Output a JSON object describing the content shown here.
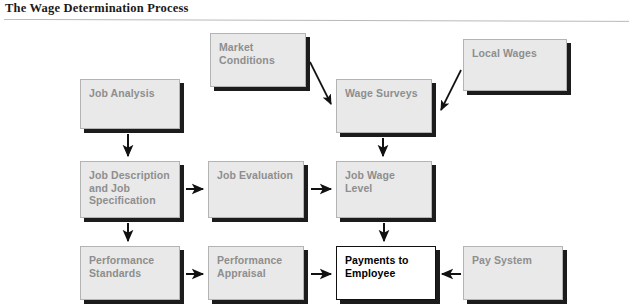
{
  "title": "The Wage Determination Process",
  "diagram": {
    "type": "flowchart",
    "nodes": [
      {
        "id": "market-conditions",
        "label": "Market\nConditions",
        "style": "shaded",
        "x": 210,
        "y": 33,
        "w": 96,
        "h": 54
      },
      {
        "id": "local-wages",
        "label": "Local Wages",
        "style": "shaded",
        "x": 463,
        "y": 39,
        "w": 104,
        "h": 52
      },
      {
        "id": "job-analysis",
        "label": "Job Analysis",
        "style": "shaded",
        "x": 80,
        "y": 79,
        "w": 100,
        "h": 50
      },
      {
        "id": "wage-surveys",
        "label": "Wage Surveys",
        "style": "shaded",
        "x": 336,
        "y": 79,
        "w": 96,
        "h": 54
      },
      {
        "id": "job-description",
        "label": "Job Description\nand Job\nSpecification",
        "style": "shaded",
        "x": 80,
        "y": 161,
        "w": 100,
        "h": 57
      },
      {
        "id": "job-evaluation",
        "label": "Job Evaluation",
        "style": "shaded",
        "x": 208,
        "y": 161,
        "w": 96,
        "h": 57
      },
      {
        "id": "job-wage-level",
        "label": "Job Wage\nLevel",
        "style": "shaded",
        "x": 336,
        "y": 161,
        "w": 96,
        "h": 57
      },
      {
        "id": "performance-standards",
        "label": "Performance\nStandards",
        "style": "shaded",
        "x": 80,
        "y": 246,
        "w": 100,
        "h": 54
      },
      {
        "id": "performance-appraisal",
        "label": "Performance\nAppraisal",
        "style": "shaded",
        "x": 208,
        "y": 246,
        "w": 96,
        "h": 54
      },
      {
        "id": "payments-to-employee",
        "label": "Payments to\nEmployee",
        "style": "highlight",
        "x": 336,
        "y": 246,
        "w": 100,
        "h": 54
      },
      {
        "id": "pay-system",
        "label": "Pay System",
        "style": "shaded",
        "x": 463,
        "y": 246,
        "w": 100,
        "h": 54
      }
    ],
    "edges": [
      {
        "from": "market-conditions",
        "to": "wage-surveys",
        "direction": "down-right"
      },
      {
        "from": "local-wages",
        "to": "wage-surveys",
        "direction": "down-left"
      },
      {
        "from": "job-analysis",
        "to": "job-description",
        "direction": "down"
      },
      {
        "from": "wage-surveys",
        "to": "job-wage-level",
        "direction": "down"
      },
      {
        "from": "job-description",
        "to": "job-evaluation",
        "direction": "right"
      },
      {
        "from": "job-evaluation",
        "to": "job-wage-level",
        "direction": "right"
      },
      {
        "from": "job-description",
        "to": "performance-standards",
        "direction": "down"
      },
      {
        "from": "job-wage-level",
        "to": "payments-to-employee",
        "direction": "down"
      },
      {
        "from": "performance-standards",
        "to": "performance-appraisal",
        "direction": "right"
      },
      {
        "from": "performance-appraisal",
        "to": "payments-to-employee",
        "direction": "right"
      },
      {
        "from": "pay-system",
        "to": "payments-to-employee",
        "direction": "left"
      }
    ]
  },
  "colors": {
    "box_fill": "#e9e9e9",
    "box_border": "#b4b4b4",
    "box_shadow": "#1c1c1c",
    "box_text": "#8e8e8e",
    "highlight_fill": "#ffffff",
    "highlight_text": "#000000",
    "arrow": "#111111",
    "title_text": "#1a1a1a",
    "rule": "#b9b9b9"
  }
}
